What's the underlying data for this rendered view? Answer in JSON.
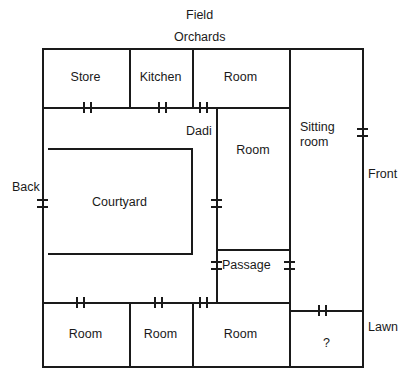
{
  "diagram": {
    "stroke_color": "#1a1a1a",
    "background_color": "#ffffff"
  },
  "exterior_labels": [
    {
      "key": "field",
      "text": "Field",
      "side": "top"
    },
    {
      "key": "orchards",
      "text": "Orchards",
      "side": "top"
    },
    {
      "key": "back",
      "text": "Back",
      "side": "left"
    },
    {
      "key": "front",
      "text": "Front",
      "side": "right"
    },
    {
      "key": "lawn",
      "text": "Lawn",
      "side": "right"
    }
  ],
  "rooms": [
    {
      "key": "store",
      "label": "Store",
      "row": "top",
      "order": 1
    },
    {
      "key": "kitchen",
      "label": "Kitchen",
      "row": "top",
      "order": 2
    },
    {
      "key": "room_top",
      "label": "Room",
      "row": "top",
      "order": 3
    },
    {
      "key": "sitting_room",
      "label_line1": "Sitting",
      "label_line2": "room",
      "row": "right",
      "order": 4
    },
    {
      "key": "dadi",
      "label": "Dadi",
      "row": "middle",
      "order": 5
    },
    {
      "key": "room_middle",
      "label": "Room",
      "row": "middle",
      "order": 6
    },
    {
      "key": "courtyard",
      "label": "Courtyard",
      "row": "middle",
      "order": 7
    },
    {
      "key": "passage",
      "label": "Passage",
      "row": "middle",
      "order": 8
    },
    {
      "key": "room_bottom_1",
      "label": "Room",
      "row": "bottom",
      "order": 9
    },
    {
      "key": "room_bottom_2",
      "label": "Room",
      "row": "bottom",
      "order": 10
    },
    {
      "key": "room_bottom_3",
      "label": "Room",
      "row": "bottom",
      "order": 11
    },
    {
      "key": "unknown_room",
      "label": "?",
      "row": "bottom",
      "order": 12
    }
  ],
  "doors": [
    {
      "key": "door-store",
      "wall": "horizontal"
    },
    {
      "key": "door-kitchen",
      "wall": "horizontal"
    },
    {
      "key": "door-room-top",
      "wall": "horizontal"
    },
    {
      "key": "door-back",
      "wall": "vertical"
    },
    {
      "key": "door-front",
      "wall": "vertical"
    },
    {
      "key": "door-courtyard-e",
      "wall": "vertical"
    },
    {
      "key": "door-passage-w",
      "wall": "vertical"
    },
    {
      "key": "door-passage-e",
      "wall": "vertical"
    },
    {
      "key": "door-room-bottom-1",
      "wall": "horizontal"
    },
    {
      "key": "door-room-bottom-2",
      "wall": "horizontal"
    },
    {
      "key": "door-room-bottom-3",
      "wall": "horizontal"
    },
    {
      "key": "door-unknown-room",
      "wall": "horizontal"
    }
  ]
}
